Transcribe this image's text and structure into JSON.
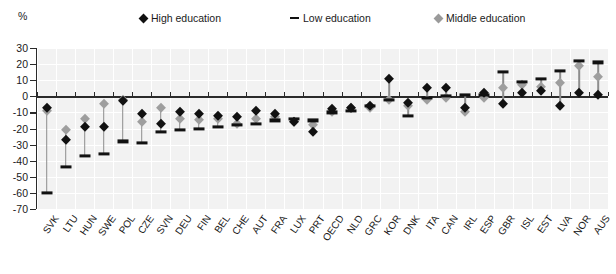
{
  "axis_unit_label": "%",
  "legend": {
    "items": [
      {
        "label": "High education",
        "marker": "diamond-black-icon",
        "color": "#111111"
      },
      {
        "label": "Low education",
        "marker": "dash-black-icon",
        "color": "#111111"
      },
      {
        "label": "Middle education",
        "marker": "diamond-gray-icon",
        "color": "#9e9e9e"
      }
    ]
  },
  "chart_data": {
    "type": "scatter",
    "title": "",
    "subtitle": "",
    "xlabel": "",
    "ylabel": "%",
    "ylim": [
      -70,
      30
    ],
    "ytick_step": 10,
    "yticks": [
      30,
      20,
      10,
      0,
      -10,
      -20,
      -30,
      -40,
      -50,
      -60,
      -70
    ],
    "ytick_labels": [
      "30",
      "20",
      "10",
      "0",
      "-10",
      "-20",
      "-30",
      "-40",
      "-50",
      "-60",
      "-70"
    ],
    "grid": true,
    "legend_position": "top",
    "categories": [
      "SVK",
      "LTU",
      "HUN",
      "SWE",
      "POL",
      "CZE",
      "SVN",
      "DEU",
      "FIN",
      "BEL",
      "CHE",
      "AUT",
      "FRA",
      "LUX",
      "PRT",
      "OECD",
      "NLD",
      "GRC",
      "KOR",
      "DNK",
      "ITA",
      "CAN",
      "IRL",
      "ESP",
      "GBR",
      "ISL",
      "EST",
      "LVA",
      "NOR",
      "AUS"
    ],
    "series": [
      {
        "name": "High education",
        "marker": "diamond",
        "color": "#111111",
        "values": [
          -7,
          -27,
          -19,
          -19,
          -3,
          -11,
          -17,
          -10,
          -11,
          -12,
          -13,
          -9,
          -11,
          -16,
          -22,
          -8,
          -7,
          -6,
          11,
          -4,
          5,
          5,
          -7,
          2,
          -5,
          2,
          3,
          -6,
          2,
          1
        ]
      },
      {
        "name": "Low education",
        "marker": "dash",
        "color": "#111111",
        "values": [
          -60,
          -44,
          -37,
          -36,
          -28,
          -29,
          -22,
          -21,
          -20,
          -19,
          -18,
          -17,
          -15,
          -14,
          -15,
          -10,
          -9,
          -6,
          -2,
          -12,
          -1,
          0,
          1,
          1,
          15,
          9,
          11,
          16,
          22,
          21
        ]
      },
      {
        "name": "Middle education",
        "marker": "diamond",
        "color": "#9e9e9e",
        "values": [
          -9,
          -21,
          -14,
          -5,
          -2,
          -16,
          -7,
          -14,
          -15,
          -14,
          -17,
          -14,
          -13,
          -16,
          -18,
          -10,
          -7,
          -7,
          -2,
          -6,
          -2,
          -1,
          -10,
          -1,
          5,
          7,
          6,
          8,
          19,
          12
        ]
      }
    ]
  }
}
